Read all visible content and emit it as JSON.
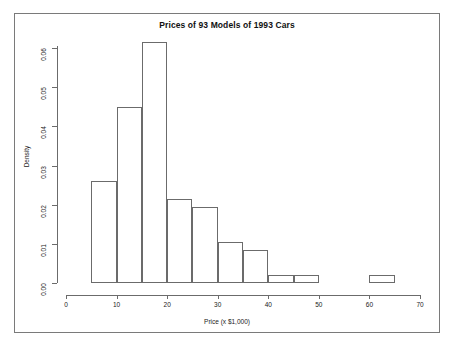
{
  "chart_data": {
    "type": "bar",
    "title": "Prices of 93 Models of 1993 Cars",
    "xlabel": "Price (x $1,000)",
    "ylabel": "Density",
    "grid": false,
    "legend": "none",
    "xlim": [
      0,
      70
    ],
    "ylim": [
      0,
      0.0615
    ],
    "xticks": [
      "0",
      "10",
      "20",
      "30",
      "40",
      "50",
      "60",
      "70"
    ],
    "xtick_values": [
      0,
      10,
      20,
      30,
      40,
      50,
      60,
      70
    ],
    "yticks": [
      "0.00",
      "0.01",
      "0.02",
      "0.03",
      "0.04",
      "0.05",
      "0.06"
    ],
    "ytick_values": [
      0.0,
      0.01,
      0.02,
      0.03,
      0.04,
      0.05,
      0.06
    ],
    "bin_width": 5,
    "bin_edges": [
      5,
      10,
      15,
      20,
      25,
      30,
      35,
      40,
      45,
      50,
      55,
      60,
      65
    ],
    "categories": [
      "5-10",
      "10-15",
      "15-20",
      "20-25",
      "25-30",
      "30-35",
      "35-40",
      "40-45",
      "45-50",
      "50-55",
      "55-60",
      "60-65"
    ],
    "values": [
      0.026,
      0.045,
      0.0615,
      0.0215,
      0.0195,
      0.0105,
      0.0085,
      0.002,
      0.002,
      0.0,
      0.0,
      0.002
    ],
    "bars": [
      {
        "label": "5-10",
        "x0": 5,
        "x1": 10,
        "density": 0.026
      },
      {
        "label": "10-15",
        "x0": 10,
        "x1": 15,
        "density": 0.045
      },
      {
        "label": "15-20",
        "x0": 15,
        "x1": 20,
        "density": 0.0615
      },
      {
        "label": "20-25",
        "x0": 20,
        "x1": 25,
        "density": 0.0215
      },
      {
        "label": "25-30",
        "x0": 25,
        "x1": 30,
        "density": 0.0195
      },
      {
        "label": "30-35",
        "x0": 30,
        "x1": 35,
        "density": 0.0105
      },
      {
        "label": "35-40",
        "x0": 35,
        "x1": 40,
        "density": 0.0085
      },
      {
        "label": "40-45",
        "x0": 40,
        "x1": 45,
        "density": 0.002
      },
      {
        "label": "45-50",
        "x0": 45,
        "x1": 50,
        "density": 0.002
      },
      {
        "label": "60-65",
        "x0": 60,
        "x1": 65,
        "density": 0.002
      }
    ],
    "colors": {
      "bar_stroke": "#6b6b6b",
      "bar_fill": "transparent",
      "axis": "#6b6b6b",
      "text": "#222222",
      "frame": "#7a7a7a",
      "background": "#ffffff"
    }
  }
}
